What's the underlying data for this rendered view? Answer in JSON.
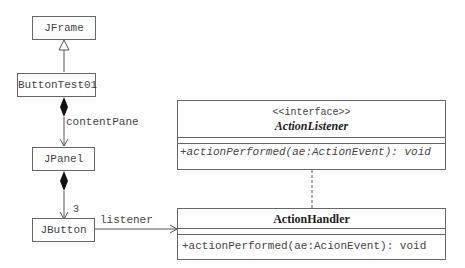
{
  "classes": {
    "jframe": "JFrame",
    "buttontest": "ButtonTest01",
    "jpanel": "JPanel",
    "jbutton": "JButton"
  },
  "interface": {
    "stereotype": "<<interface>>",
    "name": "ActionListener",
    "method": "+actionPerformed(ae:ActionEvent): void"
  },
  "handler": {
    "name": "ActionHandler",
    "method": "+actionPerformed(ae:AcionEvent): void"
  },
  "labels": {
    "content_pane": "contentPane",
    "multiplicity": "3",
    "listener": "listener"
  }
}
